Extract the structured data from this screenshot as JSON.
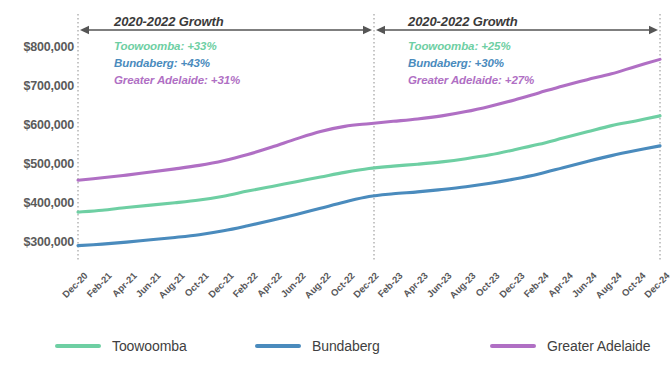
{
  "chart_data": {
    "type": "line",
    "title": "",
    "xlabel": "",
    "ylabel": "",
    "ylim": [
      250000,
      830000
    ],
    "grid": false,
    "legend_position": "bottom",
    "y_ticks": [
      "$300,000",
      "$400,000",
      "$500,000",
      "$600,000",
      "$700,000",
      "$800,000"
    ],
    "y_tick_values": [
      300000,
      400000,
      500000,
      600000,
      700000,
      800000
    ],
    "categories": [
      "Dec-20",
      "Feb-21",
      "Apr-21",
      "Jun-21",
      "Aug-21",
      "Oct-21",
      "Dec-21",
      "Feb-22",
      "Apr-22",
      "Jun-22",
      "Aug-22",
      "Oct-22",
      "Dec-22",
      "Feb-23",
      "Apr-23",
      "Jun-23",
      "Aug-23",
      "Oct-23",
      "Dec-23",
      "Feb-24",
      "Apr-24",
      "Jun-24",
      "Aug-24",
      "Oct-24",
      "Dec-24"
    ],
    "series": [
      {
        "name": "Toowoomba",
        "color": "#6ecfa3",
        "values": [
          378000,
          383000,
          390000,
          396000,
          402000,
          409000,
          419000,
          432000,
          444000,
          456000,
          468000,
          480000,
          490000,
          496000,
          501000,
          507000,
          515000,
          525000,
          538000,
          552000,
          568000,
          584000,
          600000,
          612000,
          625000
        ]
      },
      {
        "name": "Bundaberg",
        "color": "#4a8bbd",
        "values": [
          292000,
          296000,
          301000,
          307000,
          313000,
          320000,
          330000,
          343000,
          357000,
          372000,
          388000,
          404000,
          418000,
          425000,
          430000,
          436000,
          443000,
          452000,
          463000,
          476000,
          492000,
          508000,
          523000,
          536000,
          548000
        ]
      },
      {
        "name": "Greater Adelaide",
        "color": "#b06fc4",
        "values": [
          460000,
          466000,
          473000,
          481000,
          489000,
          498000,
          510000,
          526000,
          545000,
          566000,
          585000,
          598000,
          605000,
          611000,
          617000,
          625000,
          636000,
          650000,
          666000,
          684000,
          702000,
          718000,
          733000,
          752000,
          770000
        ]
      }
    ],
    "annotations": [
      {
        "id": "left",
        "title": "2020-2022 Growth",
        "span_start": "Dec-20",
        "span_end": "Dec-22",
        "items": [
          {
            "label": "Toowoomba: +33%",
            "series": "Toowoomba",
            "color": "#6ecfa3"
          },
          {
            "label": "Bundaberg: +43%",
            "series": "Bundaberg",
            "color": "#4a8bbd"
          },
          {
            "label": "Greater Adelaide: +31%",
            "series": "Greater Adelaide",
            "color": "#b06fc4"
          }
        ]
      },
      {
        "id": "right",
        "title": "2020-2022 Growth",
        "span_start": "Dec-22",
        "span_end": "Dec-24",
        "items": [
          {
            "label": "Toowoomba: +25%",
            "series": "Toowoomba",
            "color": "#6ecfa3"
          },
          {
            "label": "Bundaberg: +30%",
            "series": "Bundaberg",
            "color": "#4a8bbd"
          },
          {
            "label": "Greater Adelaide: +27%",
            "series": "Greater Adelaide",
            "color": "#b06fc4"
          }
        ]
      }
    ],
    "legend": [
      {
        "label": "Toowoomba",
        "color": "#6ecfa3"
      },
      {
        "label": "Bundaberg",
        "color": "#4a8bbd"
      },
      {
        "label": "Greater Adelaide",
        "color": "#b06fc4"
      }
    ]
  }
}
